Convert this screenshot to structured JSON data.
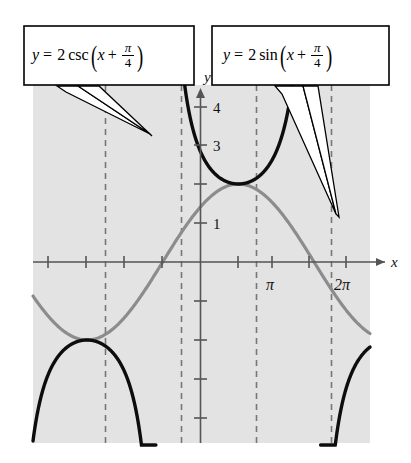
{
  "figure": {
    "kind": "trigonometric-graph",
    "background_color": "#ffffff",
    "plot_background_color": "#e3e3e3"
  },
  "axes": {
    "x_axis_label": "x",
    "y_axis_label": "y",
    "x_tick_labels": [
      "π",
      "2π"
    ],
    "y_tick_labels": [
      "1",
      "3",
      "4"
    ],
    "x_range": [
      -2.356,
      7.5
    ],
    "y_range": [
      -5.1,
      4.6
    ],
    "grid": false
  },
  "labels": {
    "csc": {
      "lhs": "y",
      "equals": "=",
      "coefficient": "2",
      "function": "csc",
      "arg_var": "x",
      "plus": "+",
      "numerator": "π",
      "denominator": "4",
      "plain": "y = 2 csc (x + π/4)"
    },
    "sin": {
      "lhs": "y",
      "equals": "=",
      "coefficient": "2",
      "function": "sin",
      "arg_var": "x",
      "plus": "+",
      "numerator": "π",
      "denominator": "4",
      "plain": "y = 2 sin (x + π/4)"
    }
  },
  "chart_data": {
    "type": "line",
    "title": "",
    "xlabel": "x",
    "ylabel": "y",
    "xlim": [
      -2.356,
      7.5
    ],
    "ylim": [
      -5.1,
      4.6
    ],
    "grid": false,
    "x_ticks": [
      -2.356,
      -1.571,
      -0.785,
      0,
      0.785,
      1.571,
      2.356,
      3.142,
      3.927,
      4.712,
      5.498,
      6.283,
      7.069
    ],
    "x_tick_labels_shown": {
      "3.142": "π",
      "6.283": "2π"
    },
    "y_ticks": [
      -5,
      -4,
      -3,
      -2,
      -1,
      1,
      2,
      3,
      4
    ],
    "y_tick_labels_shown": {
      "1": "1",
      "3": "3",
      "4": "4"
    },
    "asymptotes": [
      -0.785,
      2.356,
      5.498,
      8.639
    ],
    "series": [
      {
        "name": "y = 2 sin (x + π/4)",
        "color": "#8c8c8c",
        "style": "solid",
        "amplitude": 2,
        "phase_shift": 0.785,
        "period": 6.283,
        "key_points": [
          {
            "x": -0.785,
            "y": 0
          },
          {
            "x": 0.785,
            "y": 2
          },
          {
            "x": 2.356,
            "y": 0
          },
          {
            "x": 3.927,
            "y": -2
          },
          {
            "x": 5.498,
            "y": 0
          },
          {
            "x": 7.069,
            "y": 2
          }
        ]
      },
      {
        "name": "y = 2 csc (x + π/4)",
        "color": "#0d0d0d",
        "style": "solid",
        "amplitude": 2,
        "phase_shift": 0.785,
        "period": 6.283,
        "key_points": [
          {
            "x": 0.785,
            "y": 2
          },
          {
            "x": 3.927,
            "y": -2
          },
          {
            "x": 7.069,
            "y": 2
          }
        ]
      }
    ]
  }
}
